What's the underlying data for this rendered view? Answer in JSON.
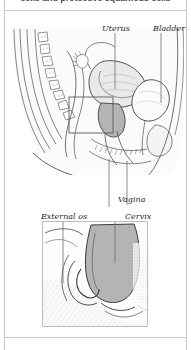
{
  "caption": {
    "text": "cells and protective squamous cells"
  },
  "figure": {
    "labels": [
      {
        "id": "uterus",
        "text": "Uterus"
      },
      {
        "id": "bladder",
        "text": "Bladder"
      },
      {
        "id": "vagina",
        "text": "Vagina"
      },
      {
        "id": "external_os",
        "text": "External os"
      },
      {
        "id": "cervix",
        "text": "Cervix"
      }
    ],
    "colors": {
      "ink": "#3a3a3a",
      "leader_line": "#6e6e6e",
      "inset_border": "#7a7a7a",
      "cervix_fill": "#b6b6b6",
      "tissue_light": "#f2f2f2",
      "page_border": "#c9c9c9",
      "background": "#ffffff"
    },
    "panels": [
      {
        "id": "overview-panel",
        "description": "midsagittal section of the female pelvis"
      },
      {
        "id": "detail-panel",
        "description": "magnified view of the cervix and external os"
      }
    ]
  }
}
